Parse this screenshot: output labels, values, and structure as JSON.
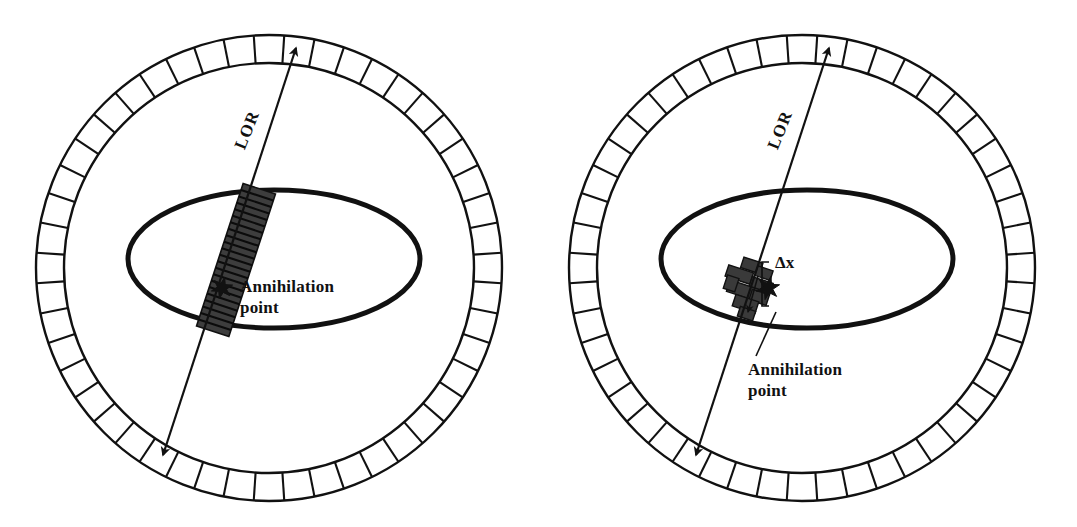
{
  "figure": {
    "type": "diagram",
    "background_color": "#ffffff",
    "ink_color": "#111111",
    "band_color": "#3a3a3a"
  },
  "panels": [
    {
      "id": "left",
      "name": "non-time-of-flight",
      "center": {
        "x": 269,
        "y": 268
      },
      "ring": {
        "outer_radius": 233,
        "inner_radius": 205,
        "segment_count": 48,
        "stroke_width": 2.4
      },
      "phantom_ellipse": {
        "cx": 274,
        "cy": 259,
        "rx": 146,
        "ry": 69,
        "stroke_width": 5
      },
      "lor": {
        "label": "LOR",
        "label_rotation_deg": -68,
        "label_x": 252,
        "label_y": 132,
        "start": {
          "x": 163,
          "y": 455
        },
        "end": {
          "x": 296,
          "y": 48
        },
        "stroke_width": 2.2,
        "arrowheads": "both"
      },
      "uncertainty_band": {
        "style": "striped-long",
        "width": 34,
        "length": 150,
        "stripe_count": 22,
        "center": {
          "x": 236,
          "y": 260
        },
        "rotation_deg": -18
      },
      "annihilation_point": {
        "marker": "star",
        "x": 222,
        "y": 288,
        "label_line_1": "Annihilation",
        "label_line_2": "point",
        "label_x": 240,
        "label_y": 292,
        "leader": false
      },
      "delta_x": null
    },
    {
      "id": "right",
      "name": "time-of-flight",
      "center": {
        "x": 802,
        "y": 268
      },
      "ring": {
        "outer_radius": 233,
        "inner_radius": 205,
        "segment_count": 48,
        "stroke_width": 2.4
      },
      "phantom_ellipse": {
        "cx": 807,
        "cy": 259,
        "rx": 146,
        "ry": 69,
        "stroke_width": 5
      },
      "lor": {
        "label": "LOR",
        "label_rotation_deg": -68,
        "label_x": 785,
        "label_y": 132,
        "start": {
          "x": 696,
          "y": 455
        },
        "end": {
          "x": 829,
          "y": 48
        },
        "stroke_width": 2.2,
        "arrowheads": "both"
      },
      "uncertainty_band": {
        "style": "blob-compact",
        "width": 46,
        "length": 44,
        "center": {
          "x": 746,
          "y": 283
        },
        "rotation_deg": -18
      },
      "annihilation_point": {
        "marker": "star",
        "x": 768,
        "y": 288,
        "label_line_1": "Annihilation",
        "label_line_2": "point",
        "label_x": 748,
        "label_y": 375,
        "leader": true,
        "leader_from": {
          "x": 756,
          "y": 356
        },
        "leader_to": {
          "x": 776,
          "y": 312
        }
      },
      "delta_x": {
        "label": "Δx",
        "label_x": 775,
        "label_y": 268,
        "bracket_x": 762,
        "bracket_top_y": 262,
        "bracket_bottom_y": 306,
        "bracket_tick": 7
      }
    }
  ]
}
